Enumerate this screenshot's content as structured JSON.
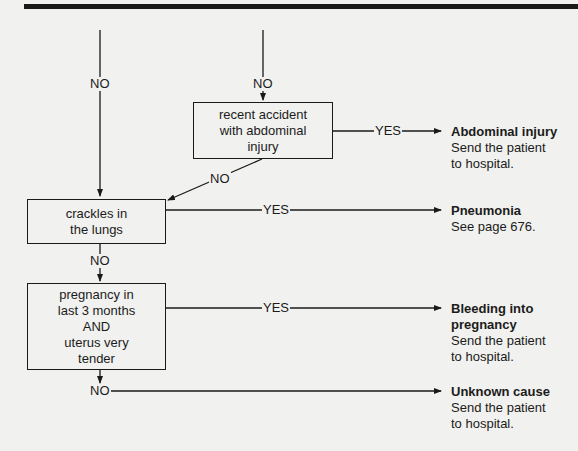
{
  "flowchart": {
    "nodes": {
      "recent_accident": {
        "lines": [
          "recent accident",
          "with abdominal",
          "injury"
        ]
      },
      "crackles": {
        "lines": [
          "crackles in",
          "the lungs"
        ]
      },
      "pregnancy": {
        "lines": [
          "pregnancy in",
          "last 3 months",
          "AND",
          "uterus very",
          "tender"
        ]
      }
    },
    "edge_labels": {
      "left_no": "NO",
      "top_no": "NO",
      "accident_yes": "YES",
      "accident_no": "NO",
      "crackles_yes": "YES",
      "crackles_no": "NO",
      "pregnancy_yes": "YES",
      "pregnancy_no": "NO"
    },
    "outcomes": {
      "abdominal": {
        "title": "Abdominal injury",
        "lines": [
          "Send the patient",
          "to hospital."
        ]
      },
      "pneumonia": {
        "title": "Pneumonia",
        "lines": [
          "See page 676."
        ]
      },
      "bleeding": {
        "title_lines": [
          "Bleeding into",
          "pregnancy"
        ],
        "lines": [
          "Send the patient",
          "to hospital."
        ]
      },
      "unknown": {
        "title": "Unknown cause",
        "lines": [
          "Send the patient",
          "to hospital."
        ]
      }
    },
    "colors": {
      "ink": "#1a1a1a",
      "paper": "#f1f1ef"
    }
  }
}
